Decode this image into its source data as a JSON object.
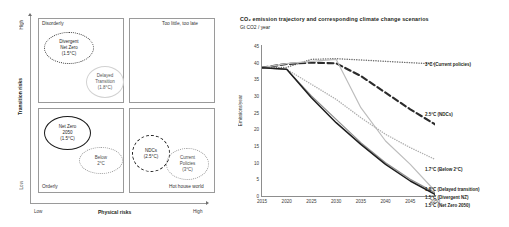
{
  "matrix": {
    "y_axis": {
      "name": "Transition risks",
      "high": "High",
      "low": "Low"
    },
    "x_axis": {
      "name": "Physical risks",
      "low": "Low",
      "high": "High"
    },
    "quadrants": [
      {
        "key": "disorderly",
        "label": "Disorderly"
      },
      {
        "key": "too-little-too-late",
        "label": "Too little, too late"
      },
      {
        "key": "orderly",
        "label": "Orderly"
      },
      {
        "key": "hot-house-world",
        "label": "Hot house world"
      }
    ],
    "bubbles": [
      {
        "key": "divergent-net-zero",
        "lines": [
          "Divergent",
          "Net Zero",
          "(1.5°C)"
        ]
      },
      {
        "key": "delayed-transition",
        "lines": [
          "Delayed",
          "Transition",
          "(1.8°C)"
        ]
      },
      {
        "key": "net-zero-2050",
        "lines": [
          "Net Zero",
          "2050",
          "(1.5°C)"
        ]
      },
      {
        "key": "below-2c",
        "lines": [
          "Below",
          "2°C"
        ]
      },
      {
        "key": "ndcs",
        "lines": [
          "NDCs",
          "(2.5°C)"
        ]
      },
      {
        "key": "current-policies",
        "lines": [
          "Current",
          "Policies",
          "(3°C)"
        ]
      }
    ]
  },
  "chart_data": {
    "type": "line",
    "title": "CO₂ emission trajectory and corresponding climate change scenarios",
    "subtitle": "Gt CO2 / year",
    "xlabel": "",
    "ylabel": "Emissions/year",
    "xlim": [
      2015,
      2050
    ],
    "ylim": [
      0,
      45
    ],
    "x_ticks": [
      2015,
      2020,
      2025,
      2030,
      2035,
      2040,
      2045,
      2050
    ],
    "y_ticks": [
      0,
      5,
      10,
      15,
      20,
      25,
      30,
      35,
      40,
      45
    ],
    "grid": false,
    "legend_position": "right",
    "x": [
      2015,
      2020,
      2025,
      2030,
      2035,
      2040,
      2045,
      2050
    ],
    "series": [
      {
        "name": "3°C (Current policies)",
        "style": "dotted",
        "color": "#6e6e6e",
        "values": [
          38.5,
          38.6,
          41.0,
          41.2,
          40.8,
          40.4,
          40.0,
          39.6
        ]
      },
      {
        "name": "2.5°C (NDCs)",
        "style": "dashed",
        "color": "#2b2b2b",
        "values": [
          38.5,
          39.6,
          40.0,
          39.8,
          36.0,
          31.0,
          26.0,
          21.5
        ]
      },
      {
        "name": "1.8°C (Delayed transition)",
        "style": "solid",
        "color": "#bdbdbd",
        "values": [
          38.5,
          39.7,
          40.4,
          41.0,
          26.5,
          16.5,
          9.5,
          1.5
        ]
      },
      {
        "name": "1.7°C (Below 2°C)",
        "style": "dotted",
        "color": "#b0b0b0",
        "values": [
          38.5,
          38.0,
          33.5,
          29.0,
          23.5,
          18.5,
          14.5,
          11.0
        ]
      },
      {
        "name": "1.5°C (Divergent NZ)",
        "style": "solid",
        "color": "#8f8f8f",
        "values": [
          38.5,
          38.0,
          30.0,
          23.0,
          16.0,
          10.0,
          5.0,
          1.0
        ]
      },
      {
        "name": "1.5°C (Net Zero 2050)",
        "style": "solid",
        "color": "#1e1e1e",
        "values": [
          38.5,
          38.0,
          29.5,
          22.0,
          15.5,
          9.5,
          4.5,
          0.5
        ]
      }
    ],
    "legend": [
      {
        "key": "current-policies",
        "label": "3°C (Current policies)",
        "y": 62
      },
      {
        "key": "ndcs",
        "label": "2.5°C (NDCs)",
        "y": 112
      },
      {
        "key": "below-2c",
        "label": "1.7°C (Below 2°C)",
        "y": 167
      },
      {
        "key": "delayed-transition",
        "label": "1.8°C (Delayed transition)",
        "y": 187
      },
      {
        "key": "divergent-nz",
        "label": "1.5°C (Divergent NZ)",
        "y": 195
      },
      {
        "key": "net-zero-2050",
        "label": "1.5°C (Net Zero 2050)",
        "y": 203
      }
    ]
  }
}
